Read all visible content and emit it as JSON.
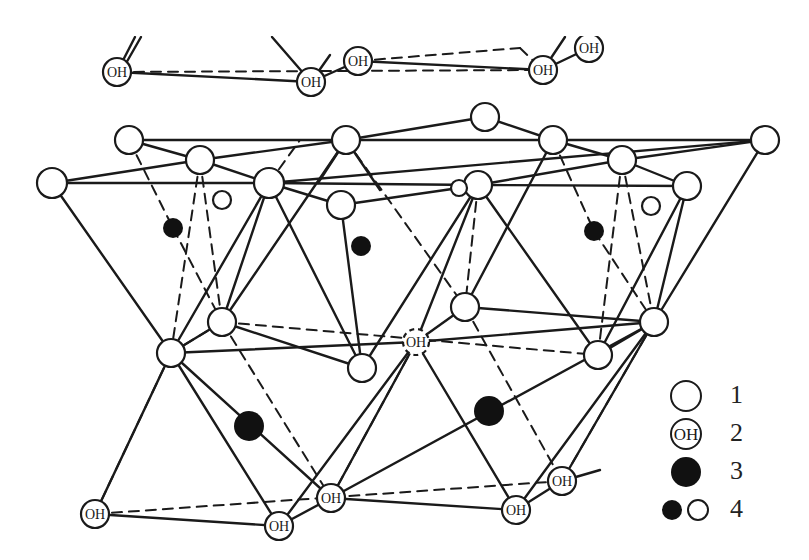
{
  "figure": {
    "type": "crystal-structure-diagram"
  },
  "colors": {
    "line": "#1a1a1a",
    "fill_dark": "#111111",
    "background": "#ffffff"
  },
  "node_label": "OH",
  "legend": {
    "items": [
      {
        "key": "1",
        "symbol": "open-circle",
        "label": "1"
      },
      {
        "key": "2",
        "symbol": "oh-circle",
        "label": "2",
        "symbol_text": "OH"
      },
      {
        "key": "3",
        "symbol": "filled-circle",
        "label": "3"
      },
      {
        "key": "4",
        "symbol": "small-filled-and-open",
        "label": "4"
      }
    ]
  },
  "nodes": {
    "top_oh": [
      {
        "x": 117,
        "y": 72,
        "r": 14
      },
      {
        "x": 311,
        "y": 82,
        "r": 14
      },
      {
        "x": 358,
        "y": 61,
        "r": 14
      },
      {
        "x": 543,
        "y": 70,
        "r": 14
      },
      {
        "x": 589,
        "y": 48,
        "r": 14
      }
    ],
    "upper_oxygen": [
      {
        "x": 129,
        "y": 140,
        "r": 14
      },
      {
        "x": 200,
        "y": 160,
        "r": 14
      },
      {
        "x": 52,
        "y": 183,
        "r": 15
      },
      {
        "x": 269,
        "y": 183,
        "r": 15
      },
      {
        "x": 346,
        "y": 140,
        "r": 14
      },
      {
        "x": 485,
        "y": 117,
        "r": 14
      },
      {
        "x": 553,
        "y": 140,
        "r": 14
      },
      {
        "x": 622,
        "y": 160,
        "r": 14
      },
      {
        "x": 765,
        "y": 140,
        "r": 14
      },
      {
        "x": 687,
        "y": 186,
        "r": 14
      },
      {
        "x": 341,
        "y": 205,
        "r": 14
      },
      {
        "x": 478,
        "y": 185,
        "r": 14
      },
      {
        "x": 459,
        "y": 188,
        "r": 8
      }
    ],
    "small_open": [
      {
        "x": 222,
        "y": 200,
        "r": 9
      },
      {
        "x": 651,
        "y": 206,
        "r": 9
      }
    ],
    "small_filled": [
      {
        "x": 173,
        "y": 228,
        "r": 10
      },
      {
        "x": 361,
        "y": 246,
        "r": 10
      },
      {
        "x": 594,
        "y": 231,
        "r": 10
      }
    ],
    "middle_oxygen": [
      {
        "x": 222,
        "y": 322,
        "r": 14
      },
      {
        "x": 171,
        "y": 353,
        "r": 14
      },
      {
        "x": 362,
        "y": 368,
        "r": 14
      },
      {
        "x": 465,
        "y": 307,
        "r": 14
      },
      {
        "x": 598,
        "y": 355,
        "r": 14
      },
      {
        "x": 654,
        "y": 322,
        "r": 14
      }
    ],
    "middle_oh_dashed": [
      {
        "x": 416,
        "y": 342,
        "r": 13
      }
    ],
    "large_filled": [
      {
        "x": 249,
        "y": 426,
        "r": 15
      },
      {
        "x": 489,
        "y": 411,
        "r": 15
      }
    ],
    "bottom_oh": [
      {
        "x": 95,
        "y": 514,
        "r": 14
      },
      {
        "x": 279,
        "y": 526,
        "r": 14
      },
      {
        "x": 331,
        "y": 498,
        "r": 14
      },
      {
        "x": 516,
        "y": 510,
        "r": 14
      },
      {
        "x": 562,
        "y": 481,
        "r": 14
      }
    ]
  },
  "edges": {
    "solid": [
      [
        117,
        72,
        311,
        82
      ],
      [
        311,
        82,
        358,
        61
      ],
      [
        358,
        61,
        543,
        70
      ],
      [
        543,
        70,
        589,
        48
      ],
      [
        117,
        72,
        135,
        37
      ],
      [
        121,
        72,
        141,
        37
      ],
      [
        311,
        82,
        272,
        37
      ],
      [
        543,
        70,
        565,
        37
      ],
      [
        311,
        82,
        330,
        55
      ],
      [
        129,
        140,
        200,
        160
      ],
      [
        129,
        140,
        346,
        140
      ],
      [
        200,
        160,
        346,
        140
      ],
      [
        200,
        160,
        269,
        183
      ],
      [
        52,
        183,
        200,
        160
      ],
      [
        52,
        183,
        269,
        183
      ],
      [
        269,
        183,
        765,
        140
      ],
      [
        269,
        183,
        478,
        185
      ],
      [
        346,
        140,
        485,
        117
      ],
      [
        346,
        140,
        553,
        140
      ],
      [
        346,
        140,
        318,
        183
      ],
      [
        346,
        140,
        380,
        190
      ],
      [
        485,
        117,
        553,
        140
      ],
      [
        553,
        140,
        622,
        160
      ],
      [
        553,
        140,
        765,
        140
      ],
      [
        622,
        160,
        687,
        186
      ],
      [
        622,
        160,
        478,
        185
      ],
      [
        478,
        185,
        687,
        186
      ],
      [
        765,
        140,
        622,
        160
      ],
      [
        341,
        205,
        459,
        188
      ],
      [
        269,
        183,
        341,
        205
      ],
      [
        0,
        0,
        0,
        0
      ],
      [
        52,
        183,
        171,
        353
      ],
      [
        269,
        183,
        171,
        353
      ],
      [
        269,
        183,
        222,
        322
      ],
      [
        269,
        183,
        362,
        368
      ],
      [
        341,
        205,
        362,
        368
      ],
      [
        346,
        140,
        222,
        322
      ],
      [
        478,
        185,
        362,
        368
      ],
      [
        478,
        185,
        598,
        355
      ],
      [
        478,
        185,
        416,
        342
      ],
      [
        553,
        140,
        465,
        307
      ],
      [
        687,
        186,
        598,
        355
      ],
      [
        765,
        140,
        654,
        322
      ],
      [
        687,
        186,
        654,
        322
      ],
      [
        171,
        353,
        222,
        322
      ],
      [
        171,
        353,
        416,
        342
      ],
      [
        222,
        322,
        362,
        368
      ],
      [
        465,
        307,
        654,
        322
      ],
      [
        416,
        342,
        654,
        322
      ],
      [
        416,
        342,
        465,
        307
      ],
      [
        598,
        355,
        654,
        322
      ],
      [
        171,
        353,
        95,
        514
      ],
      [
        171,
        353,
        279,
        526
      ],
      [
        171,
        353,
        331,
        498
      ],
      [
        416,
        342,
        279,
        526
      ],
      [
        416,
        342,
        516,
        510
      ],
      [
        416,
        342,
        331,
        498
      ],
      [
        654,
        322,
        516,
        510
      ],
      [
        654,
        322,
        562,
        481
      ],
      [
        654,
        322,
        331,
        498
      ],
      [
        95,
        514,
        279,
        526
      ],
      [
        279,
        526,
        331,
        498
      ],
      [
        516,
        510,
        562,
        481
      ],
      [
        331,
        498,
        516,
        510
      ],
      [
        562,
        481,
        600,
        470
      ]
    ],
    "dashed": [
      [
        117,
        72,
        543,
        70
      ],
      [
        358,
        61,
        520,
        48
      ],
      [
        520,
        48,
        543,
        70
      ],
      [
        129,
        140,
        173,
        228
      ],
      [
        200,
        160,
        171,
        353
      ],
      [
        200,
        160,
        222,
        322
      ],
      [
        173,
        228,
        222,
        322
      ],
      [
        269,
        183,
        300,
        140
      ],
      [
        478,
        185,
        465,
        307
      ],
      [
        553,
        140,
        594,
        231
      ],
      [
        594,
        231,
        654,
        322
      ],
      [
        622,
        160,
        598,
        355
      ],
      [
        622,
        160,
        654,
        322
      ],
      [
        346,
        140,
        465,
        307
      ],
      [
        222,
        322,
        598,
        355
      ],
      [
        222,
        322,
        331,
        498
      ],
      [
        171,
        353,
        95,
        514
      ],
      [
        465,
        307,
        562,
        481
      ],
      [
        416,
        342,
        331,
        498
      ],
      [
        95,
        514,
        562,
        481
      ],
      [
        654,
        322,
        562,
        481
      ],
      [
        222,
        322,
        171,
        353
      ]
    ]
  }
}
